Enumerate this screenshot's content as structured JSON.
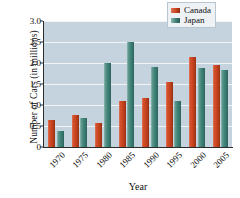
{
  "chart_data": {
    "type": "bar",
    "title": "",
    "xlabel": "Year",
    "ylabel": "Number of Cars (in millions)",
    "categories": [
      "1970",
      "1975",
      "1980",
      "1985",
      "1990",
      "1995",
      "2000",
      "2005"
    ],
    "series": [
      {
        "name": "Canada",
        "color": "#c8441f",
        "values": [
          0.65,
          0.77,
          0.57,
          1.1,
          1.17,
          1.55,
          2.15,
          1.95
        ]
      },
      {
        "name": "Japan",
        "color": "#3e8076",
        "values": [
          0.37,
          0.68,
          2.0,
          2.5,
          1.9,
          1.1,
          1.88,
          1.83
        ]
      }
    ],
    "ylim": [
      0,
      3.0
    ],
    "yticks": [
      "0",
      "0.5",
      "1.0",
      "1.5",
      "2.0",
      "2.5",
      "3.0"
    ],
    "ytick_values": [
      0,
      0.5,
      1.0,
      1.5,
      2.0,
      2.5,
      3.0
    ],
    "grid": true,
    "legend_position": "top-right",
    "plot_background": "#c4d3de",
    "gridline_color": "#f0f4f7"
  }
}
